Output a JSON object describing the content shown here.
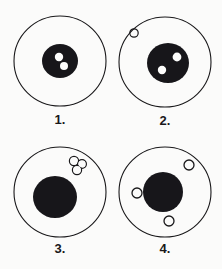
{
  "figure": {
    "background_color": "#fbfbfa",
    "ink_color": "#19181a",
    "nucleus_color": "#17161a",
    "vacuole_fill": "#fdfdfc",
    "panel_count": 4
  },
  "panels": [
    {
      "label": "1.",
      "membrane": {
        "cx": 52,
        "cy": 49,
        "rx": 46,
        "ry": 45
      },
      "nucleus": {
        "cx": 52,
        "cy": 49,
        "rx": 18,
        "ry": 17,
        "filled": true
      },
      "inner_spots": [
        {
          "cx": 51,
          "cy": 45,
          "r": 4.2,
          "fill": "white"
        },
        {
          "cx": 56,
          "cy": 54,
          "r": 4.0,
          "fill": "white"
        }
      ],
      "outer_bodies": []
    },
    {
      "label": "2.",
      "membrane": {
        "cx": 52,
        "cy": 48,
        "rx": 46,
        "ry": 45
      },
      "nucleus": {
        "cx": 55,
        "cy": 49,
        "rx": 21,
        "ry": 20,
        "filled": true
      },
      "inner_spots": [
        {
          "cx": 64,
          "cy": 43,
          "r": 4.4,
          "fill": "white"
        },
        {
          "cx": 49,
          "cy": 56,
          "r": 4.2,
          "fill": "white"
        }
      ],
      "outer_bodies": [
        {
          "cx": 21,
          "cy": 19,
          "r": 4.2,
          "type": "hollow-circle"
        }
      ]
    },
    {
      "label": "3.",
      "membrane": {
        "cx": 52,
        "cy": 49,
        "rx": 46,
        "ry": 45
      },
      "nucleus": {
        "cx": 47,
        "cy": 54,
        "rx": 22,
        "ry": 21,
        "filled": true
      },
      "inner_spots": [],
      "outer_bodies": [
        {
          "cx": 69,
          "cy": 22,
          "r": 5.0,
          "type": "trefoil",
          "lobes": [
            {
              "cx": 66,
              "cy": 18,
              "r": 4.6
            },
            {
              "cx": 74,
              "cy": 21,
              "r": 4.4
            },
            {
              "cx": 69,
              "cy": 27,
              "r": 4.6
            }
          ]
        }
      ]
    },
    {
      "label": "4.",
      "membrane": {
        "cx": 52,
        "cy": 49,
        "rx": 46,
        "ry": 45
      },
      "nucleus": {
        "cx": 50,
        "cy": 49,
        "rx": 20,
        "ry": 20,
        "filled": true
      },
      "inner_spots": [],
      "outer_bodies": [
        {
          "cx": 76,
          "cy": 22,
          "r": 5.0,
          "type": "hollow-circle"
        },
        {
          "cx": 24,
          "cy": 50,
          "r": 5.0,
          "type": "hollow-circle"
        },
        {
          "cx": 56,
          "cy": 78,
          "r": 5.0,
          "type": "hollow-circle"
        }
      ]
    }
  ]
}
